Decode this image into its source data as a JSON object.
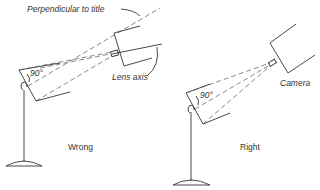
{
  "diagram": {
    "panels": [
      {
        "id": "wrong",
        "caption": "Wrong",
        "angle_label": "90°",
        "annotations": {
          "perpendicular": "Perpendicular to title",
          "lens_axis": "Lens axis"
        }
      },
      {
        "id": "right",
        "caption": "Right",
        "angle_label": "90°",
        "annotations": {
          "camera": "Camera"
        }
      }
    ]
  }
}
